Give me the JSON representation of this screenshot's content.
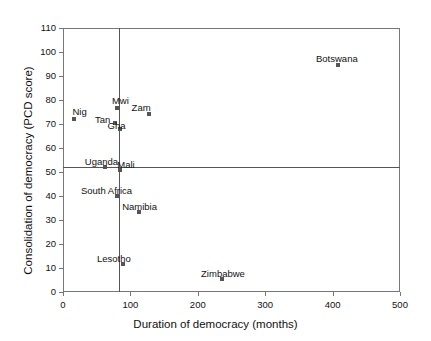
{
  "chart_data": {
    "type": "scatter",
    "title": "",
    "xlabel": "Duration of democracy (months)",
    "ylabel": "Consolidation of democracy (PCD score)",
    "xlim": [
      0,
      500
    ],
    "ylim": [
      0,
      110
    ],
    "xticks": [
      "0",
      "100",
      "200",
      "300",
      "400",
      "500"
    ],
    "yticks": [
      "0",
      "10",
      "20",
      "30",
      "40",
      "50",
      "60",
      "70",
      "80",
      "90",
      "100",
      "110"
    ],
    "grid": false,
    "legend": "none",
    "marker_color": "#555555",
    "axis_color": "#777777",
    "reference_lines": [
      {
        "orientation": "vertical",
        "value": 83,
        "axis": "x"
      },
      {
        "orientation": "horizontal",
        "value": 52,
        "axis": "y"
      }
    ],
    "points": [
      {
        "label": "Nig",
        "x": 17,
        "y": 72,
        "label_dx": -2,
        "label_dy": -13
      },
      {
        "label": "Mwi",
        "x": 80,
        "y": 76.5,
        "label_dx": -5,
        "label_dy": -13
      },
      {
        "label": "Zam",
        "x": 127,
        "y": 74,
        "label_dx": -17,
        "label_dy": -12
      },
      {
        "label": "Tan",
        "x": 77,
        "y": 70.5,
        "label_dx": -20,
        "label_dy": -9
      },
      {
        "label": "Gha",
        "x": 84,
        "y": 68,
        "label_dx": -12,
        "label_dy": -9
      },
      {
        "label": "Uganda",
        "x": 62,
        "y": 52,
        "label_dx": -20,
        "label_dy": -11
      },
      {
        "label": "Mali",
        "x": 85,
        "y": 51,
        "label_dx": -3,
        "label_dy": -11
      },
      {
        "label": "South Africa",
        "x": 80,
        "y": 40,
        "label_dx": -36,
        "label_dy": -11
      },
      {
        "label": "Namibia",
        "x": 113,
        "y": 33.5,
        "label_dx": -17,
        "label_dy": -11
      },
      {
        "label": "Lesotho",
        "x": 89,
        "y": 11.5,
        "label_dx": -26,
        "label_dy": -11
      },
      {
        "label": "Zimbabwe",
        "x": 236,
        "y": 5.5,
        "label_dx": -21,
        "label_dy": -11
      },
      {
        "label": "Botswana",
        "x": 408,
        "y": 94.5,
        "label_dx": -22,
        "label_dy": -12
      }
    ]
  }
}
